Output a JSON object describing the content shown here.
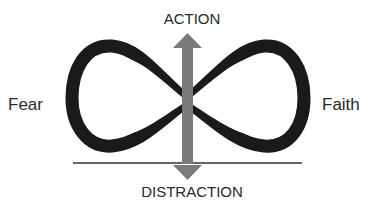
{
  "diagram": {
    "labels": {
      "top": "ACTION",
      "bottom": "DISTRACTION",
      "left": "Fear",
      "right": "Faith"
    },
    "colors": {
      "loop": "#1a1a1a",
      "arrow": "#7a7a7a",
      "baseline": "#333333",
      "text": "#2a2a2a"
    },
    "elements": [
      "infinity-loop",
      "vertical-double-arrow",
      "baseline"
    ]
  }
}
